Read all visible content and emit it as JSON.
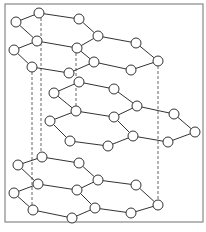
{
  "diagram": {
    "title": "",
    "colors": {
      "background": "#ffffff",
      "frame": "#888888",
      "bond": "#333333",
      "atom_fill": "#ffffff",
      "atom_stroke": "#333333",
      "dashed": "#555555"
    },
    "frame": {
      "x": 5,
      "y": 4,
      "width": 198,
      "height": 218
    },
    "atom_radius": 5,
    "layers": [
      {
        "name": "top-layer",
        "atoms": [
          [
            39,
            13
          ],
          [
            79,
            19
          ],
          [
            16,
            22
          ],
          [
            98,
            36
          ],
          [
            37,
            41
          ],
          [
            77,
            48
          ],
          [
            136,
            43
          ],
          [
            14,
            50
          ],
          [
            94,
            62
          ],
          [
            32,
            67
          ],
          [
            69,
            73
          ],
          [
            131,
            70
          ],
          [
            158,
            61
          ]
        ],
        "bonds": [
          [
            0,
            1
          ],
          [
            0,
            2
          ],
          [
            1,
            3
          ],
          [
            2,
            4
          ],
          [
            3,
            5
          ],
          [
            4,
            5
          ],
          [
            3,
            6
          ],
          [
            4,
            7
          ],
          [
            5,
            8
          ],
          [
            7,
            9
          ],
          [
            8,
            10
          ],
          [
            9,
            10
          ],
          [
            8,
            11
          ],
          [
            6,
            12
          ],
          [
            11,
            12
          ]
        ]
      },
      {
        "name": "middle-layer",
        "atoms": [
          [
            79,
            82
          ],
          [
            114,
            89
          ],
          [
            54,
            93
          ],
          [
            137,
            106
          ],
          [
            76,
            111
          ],
          [
            114,
            117
          ],
          [
            174,
            114
          ],
          [
            50,
            121
          ],
          [
            133,
            136
          ],
          [
            70,
            141
          ],
          [
            108,
            146
          ],
          [
            168,
            142
          ],
          [
            195,
            132
          ]
        ],
        "bonds": [
          [
            0,
            1
          ],
          [
            0,
            2
          ],
          [
            1,
            3
          ],
          [
            2,
            4
          ],
          [
            3,
            5
          ],
          [
            4,
            5
          ],
          [
            3,
            6
          ],
          [
            4,
            7
          ],
          [
            5,
            8
          ],
          [
            7,
            9
          ],
          [
            8,
            10
          ],
          [
            9,
            10
          ],
          [
            8,
            11
          ],
          [
            6,
            12
          ],
          [
            11,
            12
          ]
        ]
      },
      {
        "name": "bottom-layer",
        "atoms": [
          [
            42,
            157
          ],
          [
            79,
            163
          ],
          [
            18,
            165
          ],
          [
            98,
            180
          ],
          [
            38,
            184
          ],
          [
            77,
            190
          ],
          [
            136,
            185
          ],
          [
            14,
            193
          ],
          [
            95,
            208
          ],
          [
            33,
            210
          ],
          [
            72,
            218
          ],
          [
            131,
            213
          ],
          [
            158,
            205
          ]
        ],
        "bonds": [
          [
            0,
            1
          ],
          [
            0,
            2
          ],
          [
            1,
            3
          ],
          [
            2,
            4
          ],
          [
            3,
            5
          ],
          [
            4,
            5
          ],
          [
            3,
            6
          ],
          [
            4,
            7
          ],
          [
            5,
            8
          ],
          [
            7,
            9
          ],
          [
            8,
            10
          ],
          [
            9,
            10
          ],
          [
            8,
            11
          ],
          [
            6,
            12
          ],
          [
            11,
            12
          ]
        ]
      }
    ],
    "dashed_lines": [
      {
        "x": 32,
        "y1": 67,
        "y2": 210
      },
      {
        "x": 41,
        "y1": 13,
        "y2": 157
      },
      {
        "x": 76,
        "y1": 48,
        "y2": 111
      },
      {
        "x": 158,
        "y1": 61,
        "y2": 205
      }
    ]
  }
}
